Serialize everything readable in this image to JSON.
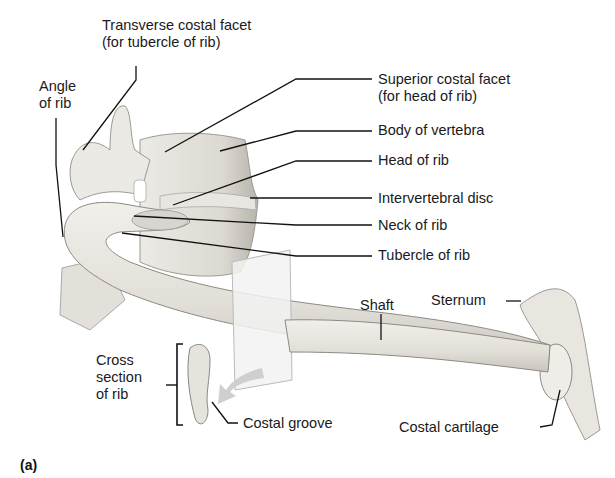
{
  "figure": {
    "panel_label": "(a)",
    "labels": {
      "transverse_costal_facet": [
        "Transverse costal facet",
        "(for tubercle of rib)"
      ],
      "angle_of_rib": [
        "Angle",
        "of rib"
      ],
      "superior_costal_facet": [
        "Superior costal facet",
        "(for head of rib)"
      ],
      "body_of_vertebra": "Body of vertebra",
      "head_of_rib": "Head of rib",
      "intervertebral_disc": "Intervertebral disc",
      "neck_of_rib": "Neck of rib",
      "tubercle_of_rib": "Tubercle of rib",
      "shaft": "Shaft",
      "sternum": "Sternum",
      "cross_section": [
        "Cross",
        "section",
        "of rib"
      ],
      "costal_groove": "Costal groove",
      "costal_cartilage": "Costal cartilage"
    },
    "colors": {
      "bone": "#e6e3dc",
      "bone_shadow": "#b9b5ad",
      "line": "#111111",
      "plane": "#efefef",
      "arrow": "#cfcfcf"
    }
  }
}
